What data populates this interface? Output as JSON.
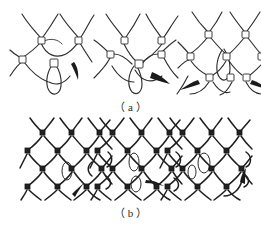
{
  "page": {
    "background_color": "#ffffff",
    "ink_color": "#2e2e30",
    "width": 261,
    "height": 225,
    "faint_top_header_text": " "
  },
  "panels": [
    {
      "id": "a",
      "label": "（ a ）",
      "caption_label_plain": "(a)",
      "description": "Coarse knitted loop formation sequence",
      "figures": [
        {
          "index": 1,
          "name": "loop-formation-step-1",
          "needle_count": 1,
          "needle_direction": "down-right",
          "node_count": 4
        },
        {
          "index": 2,
          "name": "loop-formation-step-2",
          "needle_count": 1,
          "needle_direction": "down-right",
          "node_count": 5
        },
        {
          "index": 3,
          "name": "loop-formation-step-3",
          "needle_count": 2,
          "needle_direction": "down-left-and-down-right",
          "node_count": 8
        }
      ]
    },
    {
      "id": "b",
      "label": "（ b ）",
      "caption_label_plain": "(b)",
      "description": "Dense knitted net fabric sequence",
      "figures": [
        {
          "index": 1,
          "name": "dense-net-step-1",
          "needle_count": 1,
          "needle_direction": "up-right",
          "mesh_rows": 5,
          "mesh_cols": 4
        },
        {
          "index": 2,
          "name": "dense-net-step-2",
          "needle_count": 1,
          "needle_direction": "right",
          "mesh_rows": 5,
          "mesh_cols": 4
        },
        {
          "index": 3,
          "name": "dense-net-step-3",
          "needle_count": 1,
          "needle_direction": "up-right-curved",
          "mesh_rows": 5,
          "mesh_cols": 4
        }
      ]
    }
  ]
}
